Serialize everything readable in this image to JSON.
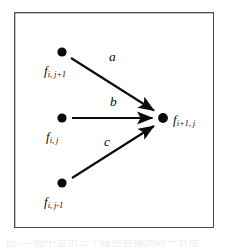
{
  "figure": {
    "frame": {
      "border_color": "#4a4a4a",
      "background_color": "#ffffff"
    },
    "ink_color": "#101010",
    "nodes": [
      {
        "id": "node-top-left",
        "base": "f",
        "subscript": "i, j+1",
        "x": 62,
        "y": 52,
        "label_x": 44,
        "label_y": 62
      },
      {
        "id": "node-middle-left",
        "base": "f",
        "subscript": "i, j",
        "x": 62,
        "y": 118,
        "label_x": 46,
        "label_y": 128
      },
      {
        "id": "node-bottom-left",
        "base": "f",
        "subscript": "i, j-1",
        "x": 62,
        "y": 183,
        "label_x": 44,
        "label_y": 193
      },
      {
        "id": "node-right",
        "base": "f",
        "subscript": "i+1, j",
        "x": 163,
        "y": 118,
        "label_x": 173,
        "label_y": 112
      }
    ],
    "arrows": [
      {
        "id": "arrow-a",
        "label": "a",
        "from": "node-top-left",
        "to": "node-right",
        "x1": 71,
        "y1": 58,
        "x2": 158,
        "y2": 113,
        "label_x": 109,
        "label_y": 57
      },
      {
        "id": "arrow-b",
        "label": "b",
        "from": "node-middle-left",
        "to": "node-right",
        "x1": 72,
        "y1": 118,
        "x2": 157,
        "y2": 118,
        "label_x": 110,
        "label_y": 100
      },
      {
        "id": "arrow-c",
        "label": "c",
        "from": "node-bottom-left",
        "to": "node-right",
        "x1": 72,
        "y1": 178,
        "x2": 158,
        "y2": 124,
        "label_x": 104,
        "label_y": 140
      }
    ],
    "node_radius": 4.6
  },
  "caption": {
    "cut_off_text": "图  —  图中显示三个路径点指向同一节点"
  }
}
